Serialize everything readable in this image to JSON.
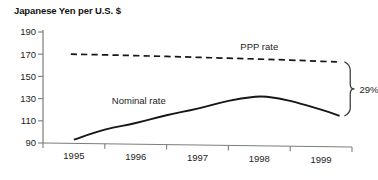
{
  "chart_data": {
    "type": "line",
    "title": "Japanese Yen per U.S. $",
    "xlabel": "",
    "ylabel": "",
    "ylim": [
      90,
      190
    ],
    "yticks": [
      90,
      110,
      130,
      150,
      170,
      190
    ],
    "ytick_labels": [
      "90",
      "110",
      "130",
      "150",
      "170",
      "190"
    ],
    "xlim": [
      1994.5,
      1999.5
    ],
    "xticks": [
      1994.5,
      1995.5,
      1996.5,
      1997.5,
      1998.5,
      1999.5
    ],
    "xtick_labels": [
      "1995",
      "1996",
      "1997",
      "1998",
      "1999"
    ],
    "grid": false,
    "legend_position": "inline-labels",
    "series": [
      {
        "name": "PPP rate",
        "style": "dashed",
        "label_x": 1998.0,
        "label_y": 177,
        "x": [
          1994.95,
          1995.5,
          1996.0,
          1996.5,
          1997.0,
          1997.5,
          1998.0,
          1998.5,
          1999.0,
          1999.3
        ],
        "values": [
          170,
          169.4,
          168.7,
          168.0,
          167.2,
          166.4,
          165.6,
          164.7,
          163.6,
          163.0
        ]
      },
      {
        "name": "Nominal rate",
        "style": "solid",
        "label_x": 1996.05,
        "label_y": 128,
        "x": [
          1995.0,
          1995.5,
          1996.0,
          1996.5,
          1997.0,
          1997.5,
          1997.9,
          1998.15,
          1998.5,
          1999.0,
          1999.3
        ],
        "values": [
          93,
          102,
          108,
          115,
          121,
          128,
          131.5,
          131.5,
          128,
          120,
          114.5
        ]
      }
    ],
    "annotations": [
      {
        "name": "gap-bracket",
        "text": "29%",
        "shape": "curly-brace",
        "x": 1999.4,
        "y_top": 163,
        "y_bottom": 114.5,
        "label_x": 1999.62,
        "label_y": 138
      }
    ]
  }
}
